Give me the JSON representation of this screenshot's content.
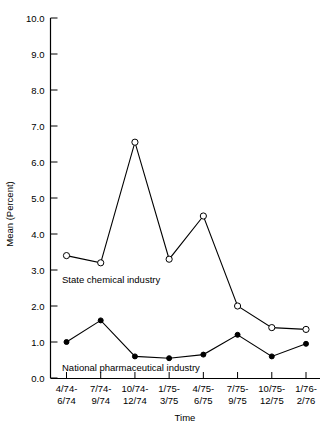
{
  "chart_data": {
    "type": "line",
    "title": "",
    "xlabel": "Time",
    "ylabel": "Mean (Percent)",
    "ylim": [
      0.0,
      10.0
    ],
    "ytick_labels": [
      "0.0",
      "1.0",
      "2.0",
      "3.0",
      "4.0",
      "5.0",
      "6.0",
      "7.0",
      "8.0",
      "9.0",
      "10.0"
    ],
    "ytick_values": [
      0.0,
      1.0,
      2.0,
      3.0,
      4.0,
      5.0,
      6.0,
      7.0,
      8.0,
      9.0,
      10.0
    ],
    "grid": false,
    "legend_position": "inline-annotation",
    "categories": [
      "4/74-\n6/74",
      "7/74-\n9/74",
      "10/74-\n12/74",
      "1/75-\n3/75",
      "4/75-\n6/75",
      "7/75-\n9/75",
      "10/75-\n12/75",
      "1/76-\n2/76"
    ],
    "categories_line1": [
      "4/74-",
      "7/74-",
      "10/74-",
      "1/75-",
      "4/75-",
      "7/75-",
      "10/75-",
      "1/76-"
    ],
    "categories_line2": [
      "6/74",
      "9/74",
      "12/74",
      "3/75",
      "6/75",
      "9/75",
      "12/75",
      "2/76"
    ],
    "series": [
      {
        "name": "State chemical industry",
        "marker": "open-circle",
        "values": [
          3.4,
          3.2,
          6.55,
          3.3,
          4.5,
          2.0,
          1.4,
          1.35
        ]
      },
      {
        "name": "National pharmaceutical industry",
        "marker": "filled-circle",
        "values": [
          1.0,
          1.6,
          0.6,
          0.55,
          0.65,
          1.2,
          0.6,
          0.95
        ]
      }
    ],
    "annotations": [
      {
        "text": "State chemical industry",
        "series": "State chemical industry"
      },
      {
        "text": "National pharmaceutical industry",
        "series": "National pharmaceutical industry"
      }
    ]
  },
  "colors": {
    "ink": "#000000",
    "background": "#ffffff"
  }
}
